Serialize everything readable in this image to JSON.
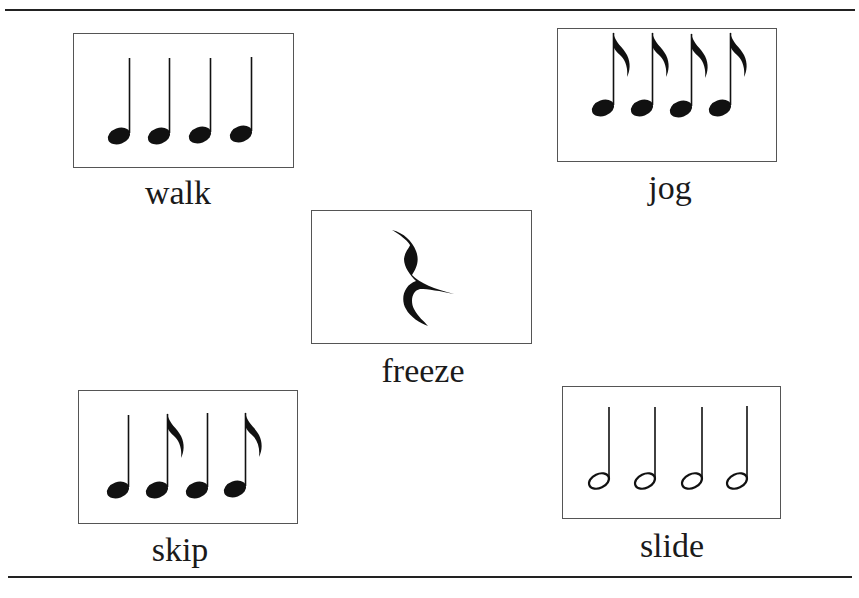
{
  "page": {
    "cropped_header_text": "",
    "cards": [
      {
        "id": "walk",
        "label": "walk",
        "note_type": "quarter",
        "notes": [
          "quarter",
          "quarter",
          "quarter",
          "quarter"
        ]
      },
      {
        "id": "jog",
        "label": "jog",
        "note_type": "eighth",
        "notes": [
          "eighth",
          "eighth",
          "eighth",
          "eighth"
        ]
      },
      {
        "id": "freeze",
        "label": "freeze",
        "note_type": "quarter-rest",
        "notes": [
          "quarter-rest"
        ]
      },
      {
        "id": "skip",
        "label": "skip",
        "note_type": "mixed",
        "notes": [
          "quarter",
          "eighth",
          "quarter",
          "eighth"
        ]
      },
      {
        "id": "slide",
        "label": "slide",
        "note_type": "half",
        "notes": [
          "half",
          "half",
          "half",
          "half"
        ]
      }
    ]
  },
  "colors": {
    "ink": "#111111",
    "border": "#555555",
    "background": "#ffffff"
  }
}
